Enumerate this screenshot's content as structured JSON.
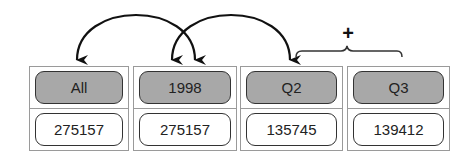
{
  "diagram": {
    "columns": [
      {
        "header": "All",
        "value": "275157"
      },
      {
        "header": "1998",
        "value": "275157"
      },
      {
        "header": "Q2",
        "value": "135745"
      },
      {
        "header": "Q3",
        "value": "139412"
      }
    ],
    "operator_label": "+",
    "arrows": [
      {
        "from": "1998",
        "to": "All"
      },
      {
        "from": "Q2",
        "to": "1998"
      }
    ],
    "bracket": {
      "spans": [
        "Q2",
        "Q3"
      ],
      "label": "+"
    },
    "colors": {
      "header_fill": "#a8a8a8",
      "value_fill": "#ffffff",
      "outline": "#333333",
      "cell_border": "#9a9a9a"
    }
  }
}
